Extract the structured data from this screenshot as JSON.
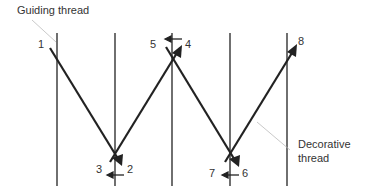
{
  "diagram": {
    "labels": {
      "guiding_thread": "Guiding thread",
      "decorative_thread_line1": "Decorative",
      "decorative_thread_line2": "thread"
    },
    "step_numbers": [
      "1",
      "2",
      "3",
      "4",
      "5",
      "6",
      "7",
      "8"
    ],
    "guiding_threads_x": [
      57,
      115,
      172,
      230,
      287
    ],
    "colors": {
      "thread": "#222222",
      "leader_line": "#bbbbbb",
      "text": "#333333"
    }
  }
}
